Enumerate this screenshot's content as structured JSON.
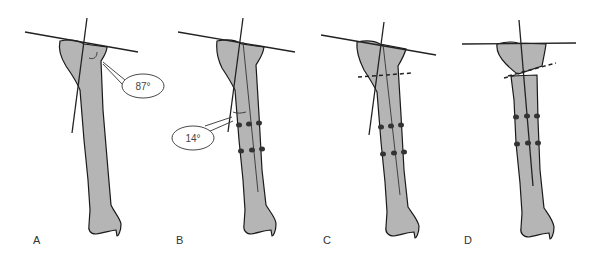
{
  "figure": {
    "panels": [
      {
        "label": "A",
        "angle_annotation": "87°"
      },
      {
        "label": "B",
        "angle_annotation": "14°"
      },
      {
        "label": "C"
      },
      {
        "label": "D"
      }
    ],
    "colors": {
      "bone_fill": "#b5b5b5",
      "outline": "#1a1a1a",
      "background": "#ffffff"
    }
  }
}
